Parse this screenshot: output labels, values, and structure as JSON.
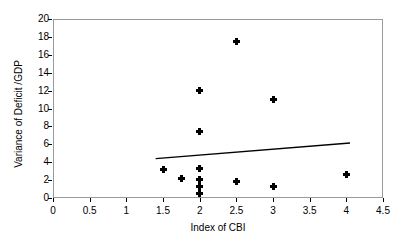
{
  "chart_data": {
    "type": "scatter",
    "title": "",
    "xlabel": "Index of CBI",
    "ylabel": "Variance of Deficit /GDP",
    "xlim": [
      0,
      4.5
    ],
    "ylim": [
      0,
      20
    ],
    "xticks": [
      "0",
      "0.5",
      "1",
      "1.5",
      "2",
      "2.5",
      "3",
      "3.5",
      "4",
      "4.5"
    ],
    "xtick_values": [
      0,
      0.5,
      1,
      1.5,
      2,
      2.5,
      3,
      3.5,
      4,
      4.5
    ],
    "yticks": [
      "0",
      "2",
      "4",
      "6",
      "8",
      "10",
      "12",
      "14",
      "16",
      "18",
      "20"
    ],
    "ytick_values": [
      0,
      2,
      4,
      6,
      8,
      10,
      12,
      14,
      16,
      18,
      20
    ],
    "grid": false,
    "legend": "none",
    "marker_style": "filled-diamond-plus",
    "marker_color": "#000000",
    "frame_color": "#9a9a9a",
    "points": [
      {
        "x": 1.5,
        "y": 3.2
      },
      {
        "x": 1.75,
        "y": 2.2
      },
      {
        "x": 2.0,
        "y": 12.0
      },
      {
        "x": 2.0,
        "y": 7.45
      },
      {
        "x": 2.0,
        "y": 3.25
      },
      {
        "x": 2.0,
        "y": 2.1
      },
      {
        "x": 2.0,
        "y": 1.25
      },
      {
        "x": 2.0,
        "y": 0.5
      },
      {
        "x": 2.5,
        "y": 17.5
      },
      {
        "x": 2.5,
        "y": 1.8
      },
      {
        "x": 3.0,
        "y": 11.0
      },
      {
        "x": 3.0,
        "y": 1.3
      },
      {
        "x": 4.0,
        "y": 2.6
      }
    ],
    "trendline": {
      "type": "linear-fit",
      "color": "#000000",
      "x_start": 1.4,
      "y_start": 4.4,
      "x_end": 4.05,
      "y_end": 6.15
    }
  }
}
